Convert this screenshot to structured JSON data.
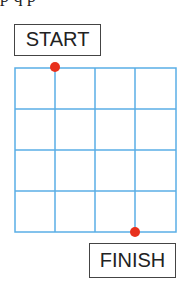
{
  "top_text_fragment": "p   q  p",
  "start_label": "START",
  "finish_label": "FINISH",
  "grid": {
    "columns": 4,
    "rows": 4,
    "line_color": "#5aaee6"
  },
  "points": {
    "start": {
      "col": 1,
      "row": 0,
      "color": "#e8301c"
    },
    "finish": {
      "col": 3,
      "row": 4,
      "color": "#e8301c"
    }
  }
}
